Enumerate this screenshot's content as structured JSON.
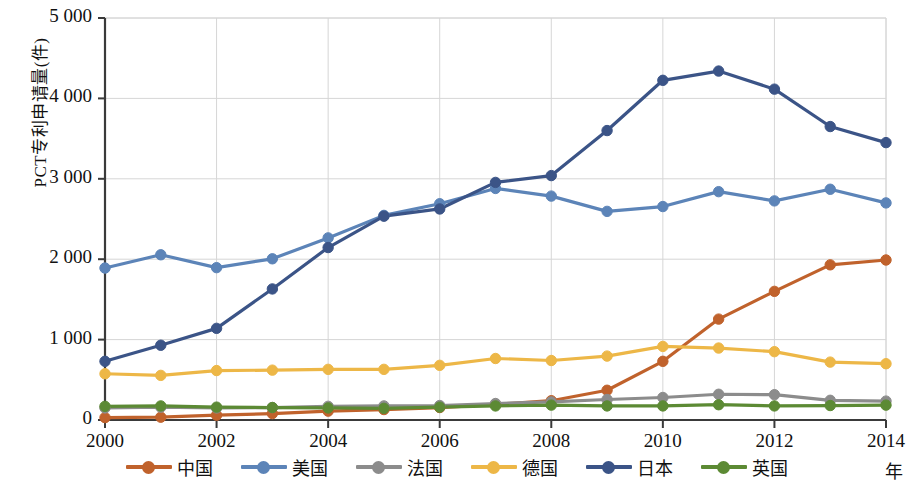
{
  "chart_data": {
    "type": "line",
    "title": "",
    "xlabel": "年",
    "ylabel": "PCT专利申请量(件)",
    "x": [
      2000,
      2001,
      2002,
      2003,
      2004,
      2005,
      2006,
      2007,
      2008,
      2009,
      2010,
      2011,
      2012,
      2013,
      2014
    ],
    "xtick_labels": [
      "2000",
      "2002",
      "2004",
      "2006",
      "2008",
      "2010",
      "2012",
      "2014"
    ],
    "xtick_values": [
      2000,
      2002,
      2004,
      2006,
      2008,
      2010,
      2012,
      2014
    ],
    "ytick_labels": [
      "0",
      "1 000",
      "2 000",
      "3 000",
      "4 000",
      "5 000"
    ],
    "ytick_values": [
      0,
      1000,
      2000,
      3000,
      4000,
      5000
    ],
    "xlim": [
      2000,
      2014
    ],
    "ylim": [
      0,
      5000
    ],
    "grid": true,
    "legend_position": "bottom",
    "series": [
      {
        "name": "中国",
        "color": "#C0622C",
        "values": [
          30,
          35,
          60,
          80,
          110,
          130,
          155,
          195,
          240,
          370,
          730,
          1255,
          1600,
          1930,
          1990
        ]
      },
      {
        "name": "美国",
        "color": "#5C84B8",
        "values": [
          1890,
          2055,
          1895,
          2005,
          2265,
          2545,
          2690,
          2880,
          2785,
          2595,
          2655,
          2840,
          2725,
          2870,
          2700
        ]
      },
      {
        "name": "法国",
        "color": "#8C8C8C",
        "values": [
          150,
          160,
          150,
          155,
          170,
          175,
          180,
          205,
          225,
          255,
          280,
          320,
          315,
          245,
          235
        ]
      },
      {
        "name": "德国",
        "color": "#EDB747",
        "values": [
          575,
          555,
          615,
          620,
          630,
          630,
          680,
          765,
          740,
          795,
          915,
          895,
          850,
          720,
          700
        ]
      },
      {
        "name": "日本",
        "color": "#3B5487",
        "values": [
          730,
          930,
          1140,
          1630,
          2145,
          2535,
          2625,
          2955,
          3040,
          3600,
          4225,
          4340,
          4115,
          3650,
          3450
        ]
      },
      {
        "name": "英国",
        "color": "#5C8A34",
        "values": [
          170,
          175,
          160,
          155,
          150,
          145,
          160,
          175,
          185,
          175,
          175,
          190,
          175,
          180,
          185
        ]
      }
    ]
  },
  "legend": {
    "items": [
      {
        "label": "中国",
        "color": "#C0622C"
      },
      {
        "label": "美国",
        "color": "#5C84B8"
      },
      {
        "label": "法国",
        "color": "#8C8C8C"
      },
      {
        "label": "德国",
        "color": "#EDB747"
      },
      {
        "label": "日本",
        "color": "#3B5487"
      },
      {
        "label": "英国",
        "color": "#5C8A34"
      }
    ],
    "x_unit": "年"
  },
  "axis": {
    "y_title": "PCT专利申请量(件)"
  }
}
